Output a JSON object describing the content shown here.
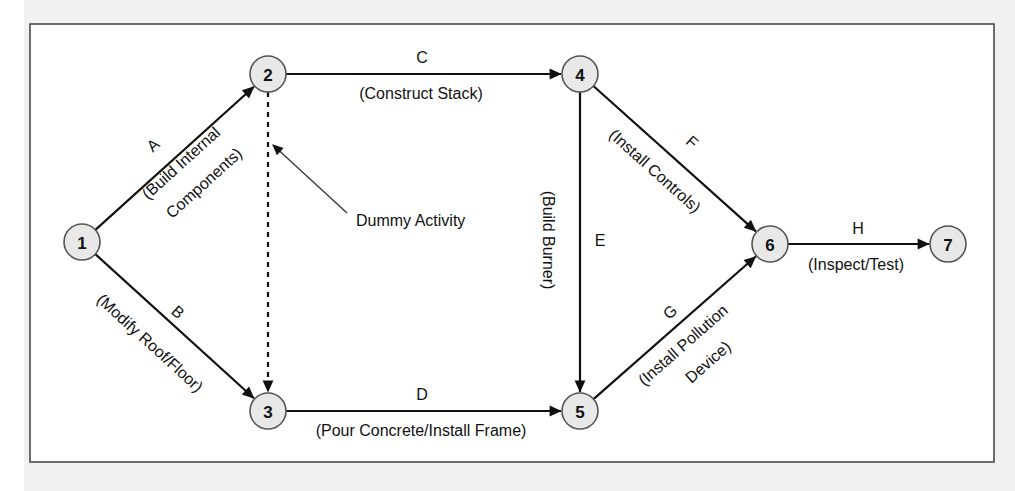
{
  "diagram": {
    "type": "activity-on-arrow network",
    "colors": {
      "node_fill": "#e8e8e8",
      "node_stroke": "#555555",
      "edge": "#111111",
      "frame_bg": "#ffffff",
      "outer_bg": "#f1f1f1"
    },
    "nodes": [
      {
        "id": "1",
        "label": "1",
        "x": 82,
        "y": 242
      },
      {
        "id": "2",
        "label": "2",
        "x": 268,
        "y": 74
      },
      {
        "id": "3",
        "label": "3",
        "x": 268,
        "y": 411
      },
      {
        "id": "4",
        "label": "4",
        "x": 580,
        "y": 74
      },
      {
        "id": "5",
        "label": "5",
        "x": 580,
        "y": 411
      },
      {
        "id": "6",
        "label": "6",
        "x": 770,
        "y": 244
      },
      {
        "id": "7",
        "label": "7",
        "x": 948,
        "y": 244
      }
    ],
    "node_radius": 18,
    "edges": [
      {
        "id": "A",
        "from": "1",
        "to": "2",
        "letter": "A",
        "description": [
          "(Build Internal",
          "Components)"
        ],
        "dashed": false,
        "letter_pos": [
          153,
          145
        ],
        "desc_pos": [
          [
            181,
            163
          ],
          [
            204,
            183
          ]
        ]
      },
      {
        "id": "B",
        "from": "1",
        "to": "3",
        "letter": "B",
        "description": [
          "(Modify Roof/Floor)"
        ],
        "dashed": false,
        "letter_pos": [
          178,
          312
        ],
        "desc_pos": [
          [
            150,
            343
          ]
        ]
      },
      {
        "id": "C",
        "from": "2",
        "to": "4",
        "letter": "C",
        "description": [
          "(Construct Stack)"
        ],
        "dashed": false,
        "letter_pos": [
          422,
          57
        ],
        "desc_pos": [
          [
            421,
            93
          ]
        ]
      },
      {
        "id": "D",
        "from": "3",
        "to": "5",
        "letter": "D",
        "description": [
          "(Pour Concrete/Install Frame)"
        ],
        "dashed": false,
        "letter_pos": [
          422,
          394
        ],
        "desc_pos": [
          [
            421,
            430
          ]
        ]
      },
      {
        "id": "E",
        "from": "4",
        "to": "5",
        "letter": "E",
        "description": [
          "(Build Burner)"
        ],
        "dashed": false,
        "letter_pos": [
          600,
          240
        ],
        "desc_pos": [
          [
            548,
            240
          ]
        ]
      },
      {
        "id": "F",
        "from": "4",
        "to": "6",
        "letter": "F",
        "description": [
          "(Install Controls)"
        ],
        "dashed": false,
        "letter_pos": [
          692,
          142
        ],
        "desc_pos": [
          [
            655,
            171
          ]
        ]
      },
      {
        "id": "G",
        "from": "5",
        "to": "6",
        "letter": "G",
        "description": [
          "(Install Pollution",
          "Device)"
        ],
        "dashed": false,
        "letter_pos": [
          670,
          312
        ],
        "desc_pos": [
          [
            683,
            345
          ],
          [
            708,
            362
          ]
        ]
      },
      {
        "id": "H",
        "from": "6",
        "to": "7",
        "letter": "H",
        "description": [
          "(Inspect/Test)"
        ],
        "dashed": false,
        "letter_pos": [
          858,
          228
        ],
        "desc_pos": [
          [
            856,
            264
          ]
        ]
      },
      {
        "id": "dummy",
        "from": "2",
        "to": "3",
        "letter": "",
        "description": [],
        "dashed": true
      }
    ],
    "callout": {
      "text": "Dummy Activity",
      "text_pos": [
        356,
        220
      ],
      "pointer_from": [
        347,
        213
      ],
      "pointer_to": [
        273,
        145
      ]
    }
  }
}
